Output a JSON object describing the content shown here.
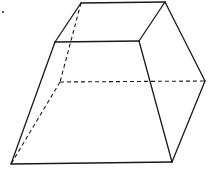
{
  "diagram": {
    "type": "frustum",
    "colors": {
      "stroke": "#1a1a1a",
      "background": "#ffffff"
    },
    "vertices": {
      "top_back_left": [
        81,
        3
      ],
      "top_back_right": [
        165,
        2
      ],
      "top_front_left": [
        55,
        42
      ],
      "top_front_right": [
        139,
        41
      ],
      "bottom_back_left": [
        60,
        82
      ],
      "bottom_back_right": [
        205,
        81
      ],
      "bottom_front_left": [
        11,
        164
      ],
      "bottom_front_right": [
        172,
        162
      ]
    },
    "solid_edges": [
      [
        "top_back_left",
        "top_back_right"
      ],
      [
        "top_back_right",
        "top_front_right"
      ],
      [
        "top_front_right",
        "top_front_left"
      ],
      [
        "top_front_left",
        "top_back_left"
      ],
      [
        "top_front_left",
        "bottom_front_left"
      ],
      [
        "top_front_right",
        "bottom_front_right"
      ],
      [
        "top_back_right",
        "bottom_back_right"
      ],
      [
        "bottom_front_left",
        "bottom_front_right"
      ],
      [
        "bottom_front_right",
        "bottom_back_right"
      ]
    ],
    "dashed_edges": [
      [
        "top_back_left",
        "bottom_back_left"
      ],
      [
        "bottom_back_left",
        "bottom_back_right"
      ],
      [
        "bottom_back_left",
        "bottom_front_left"
      ]
    ],
    "marks": [
      {
        "type": "dot",
        "position": [
          3,
          12
        ]
      }
    ]
  }
}
